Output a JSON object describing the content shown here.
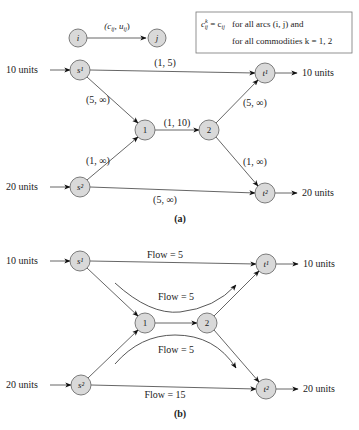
{
  "legend": {
    "node_from": "i",
    "node_to": "j",
    "arc_label": "(cij, uij)",
    "box_line1": "for all arcs (i, j) and",
    "box_line2": "for all commodities k = 1, 2",
    "box_formula": "cᵏij = cij"
  },
  "panel_a": {
    "caption": "(a)",
    "nodes": {
      "s1": "s¹",
      "s2": "s²",
      "n1": "1",
      "n2": "2",
      "t1": "t¹",
      "t2": "t²"
    },
    "supply_s1": "10 units",
    "supply_s2": "20 units",
    "demand_t1": "10 units",
    "demand_t2": "20 units",
    "arcs": [
      {
        "from": "s1",
        "to": "t1",
        "label": "(1, 5)"
      },
      {
        "from": "s1",
        "to": "1",
        "label": "(5, ∞)"
      },
      {
        "from": "s2",
        "to": "1",
        "label": "(1, ∞)"
      },
      {
        "from": "1",
        "to": "2",
        "label": "(1, 10)"
      },
      {
        "from": "2",
        "to": "t1",
        "label": "(5, ∞)"
      },
      {
        "from": "2",
        "to": "t2",
        "label": "(1, ∞)"
      },
      {
        "from": "s2",
        "to": "t2",
        "label": "(5, ∞)"
      }
    ]
  },
  "panel_b": {
    "caption": "(b)",
    "nodes": {
      "s1": "s¹",
      "s2": "s²",
      "n1": "1",
      "n2": "2",
      "t1": "t¹",
      "t2": "t²"
    },
    "supply_s1": "10 units",
    "supply_s2": "20 units",
    "demand_t1": "10 units",
    "demand_t2": "20 units",
    "flows": [
      {
        "path": "s1-t1",
        "label": "Flow = 5"
      },
      {
        "path": "s1-1-2-t1",
        "label": "Flow = 5"
      },
      {
        "path": "s2-1-2-t2",
        "label": "Flow = 5"
      },
      {
        "path": "s2-t2",
        "label": "Flow = 15"
      }
    ]
  }
}
